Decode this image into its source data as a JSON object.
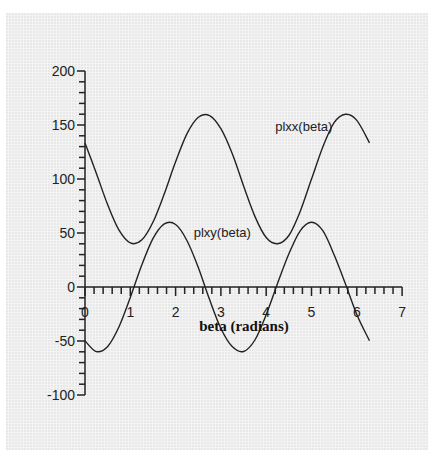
{
  "chart_data": {
    "type": "line",
    "title": "",
    "xlabel": "beta (radians)",
    "ylabel": "",
    "xlim": [
      0,
      7
    ],
    "ylim": [
      -100,
      200
    ],
    "x_ticks": [
      0,
      1,
      2,
      3,
      4,
      5,
      6,
      7
    ],
    "x_tick_labels": [
      "0",
      "1",
      "2",
      "3",
      "4",
      "5",
      "6",
      "7"
    ],
    "y_ticks": [
      -100,
      -50,
      0,
      50,
      100,
      150,
      200
    ],
    "y_tick_labels": [
      "-100",
      "-50",
      "0",
      "50",
      "100",
      "150",
      "200"
    ],
    "x_minor_step": 0.2,
    "y_minor_step": 10,
    "grid": false,
    "legend": "none (inline curve labels)",
    "x": [
      0,
      0.25,
      0.5,
      0.75,
      1.0,
      1.25,
      1.5,
      1.75,
      2.0,
      2.25,
      2.5,
      2.75,
      3.0,
      3.25,
      3.5,
      3.75,
      4.0,
      4.25,
      4.5,
      4.75,
      5.0,
      5.25,
      5.5,
      5.75,
      6.0,
      6.28
    ],
    "series": [
      {
        "name": "plxx(beta)",
        "label_pos": {
          "x": 4.2,
          "y": 144
        },
        "values": [
          133.4,
          105.4,
          76.1,
          52.6,
          40.8,
          43.4,
          59.9,
          86.3,
          115.9,
          141.8,
          157.2,
          158.7,
          146.6,
          123.6,
          93.7,
          65.4,
          45.8,
          40.1,
          47.7,
          70.0,
          99.9,
          129.7,
          152.1,
          159.9,
          154.3,
          133.5
        ]
      },
      {
        "name": "plxy(beta)",
        "label_pos": {
          "x": 2.4,
          "y": 46
        },
        "values": [
          -49.8,
          -59.8,
          -55.0,
          -36.8,
          -9.6,
          19.9,
          44.7,
          58.4,
          57.9,
          43.1,
          18.1,
          -11.7,
          -38.4,
          -55.2,
          -59.7,
          -49.1,
          -25.6,
          3.2,
          30.7,
          52.0,
          60.0,
          52.1,
          29.8,
          2.8,
          -25.4,
          -49.8
        ]
      }
    ],
    "annotations": [
      "plxx(beta)",
      "plxy(beta)"
    ]
  }
}
